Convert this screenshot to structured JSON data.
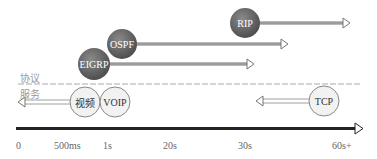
{
  "diagram": {
    "layers": {
      "upper_label": "协议",
      "lower_label": "服务"
    },
    "protocols": [
      {
        "name": "RIP",
        "cx": 245,
        "cy": 23,
        "arrow_end": 349
      },
      {
        "name": "OSPF",
        "cx": 122,
        "cy": 44,
        "arrow_end": 287
      },
      {
        "name": "EIGRP",
        "cx": 94,
        "cy": 64,
        "arrow_end": 253
      }
    ],
    "services": [
      {
        "name": "视频",
        "cx": 85,
        "cy": 102
      },
      {
        "name": "VOIP",
        "cx": 115,
        "cy": 102
      },
      {
        "name": "TCP",
        "cx": 324,
        "cy": 101
      }
    ],
    "axis": {
      "ticks": [
        {
          "label": "0",
          "x": 18
        },
        {
          "label": "500ms",
          "x": 70
        },
        {
          "label": "1s",
          "x": 109
        },
        {
          "label": "20s",
          "x": 170
        },
        {
          "label": "30s",
          "x": 246
        },
        {
          "label": "60s+",
          "x": 344
        }
      ]
    },
    "colors": {
      "protocol_fill": "#6e6e6e",
      "service_fill": "#f2f2f2",
      "arrow": "#888888",
      "axis": "#111111",
      "dashed": "#aaaaaa"
    }
  }
}
